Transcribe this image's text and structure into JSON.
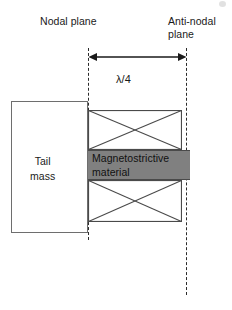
{
  "diagram": {
    "labels": {
      "nodal_plane": "Nodal plane",
      "anti_nodal_plane_line1": "Anti-nodal",
      "anti_nodal_plane_line2": "plane",
      "quarter_wavelength": "λ/4",
      "tail_mass_line1": "Tail",
      "tail_mass_line2": "mass",
      "magnetostrictive_line1": "Magnetostrictive",
      "magnetostrictive_line2": "material"
    },
    "colors": {
      "magnetostrictive_fill": "#808080",
      "line": "#2b2b2b",
      "box_stroke": "#6e6e6e",
      "background": "#ffffff",
      "text": "#1a1a1a"
    },
    "icons": {
      "dimension_arrow": "double-headed-arrow-icon",
      "coil_cross": "coil-winding-cross-icon"
    }
  }
}
